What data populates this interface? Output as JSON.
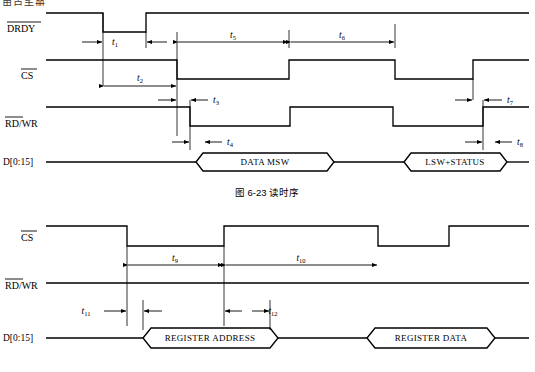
{
  "page": {
    "cut_off_header": "用户手册",
    "background": "#ffffff",
    "line_color": "#000000"
  },
  "figures": [
    {
      "id": "read-timing",
      "caption": "图 6-23    读时序",
      "signals": [
        {
          "name": "DRDY",
          "overline": "DRDY",
          "overline_span": "all"
        },
        {
          "name": "CS",
          "overline": "CS",
          "overline_span": "all"
        },
        {
          "name": "RD/WR",
          "overline": "RD",
          "overline_span": "partial"
        },
        {
          "name": "D[0:15]",
          "overline": "",
          "overline_span": "none"
        }
      ],
      "bus_cells": [
        "DATA MSW",
        "LSW+STATUS"
      ],
      "timing_marks": [
        {
          "id": "t1",
          "base": "t",
          "sub": "1"
        },
        {
          "id": "t2",
          "base": "t",
          "sub": "2"
        },
        {
          "id": "t3",
          "base": "t",
          "sub": "3"
        },
        {
          "id": "t4",
          "base": "t",
          "sub": "4"
        },
        {
          "id": "t5",
          "base": "t",
          "sub": "5"
        },
        {
          "id": "t6",
          "base": "t",
          "sub": "6"
        },
        {
          "id": "t7",
          "base": "t",
          "sub": "7"
        },
        {
          "id": "t8",
          "base": "t",
          "sub": "8"
        }
      ]
    },
    {
      "id": "register-timing",
      "caption": "",
      "signals": [
        {
          "name": "CS",
          "overline": "CS",
          "overline_span": "all"
        },
        {
          "name": "RD/WR",
          "overline": "RD",
          "overline_span": "partial"
        },
        {
          "name": "D[0:15]",
          "overline": "",
          "overline_span": "none"
        }
      ],
      "bus_cells": [
        "REGISTER ADDRESS",
        "REGISTER DATA"
      ],
      "timing_marks": [
        {
          "id": "t9",
          "base": "t",
          "sub": "9"
        },
        {
          "id": "t10",
          "base": "t",
          "sub": "10"
        },
        {
          "id": "t11",
          "base": "t",
          "sub": "11"
        },
        {
          "id": "t12",
          "base": "t",
          "sub": "12"
        }
      ]
    }
  ]
}
